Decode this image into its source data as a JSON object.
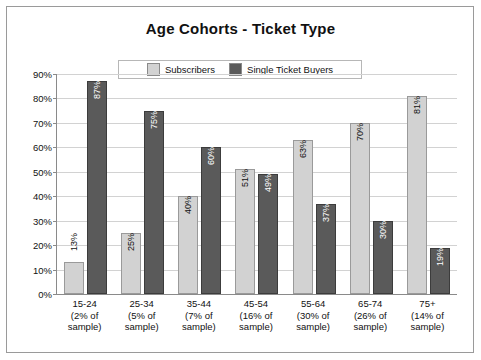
{
  "chart_data": {
    "type": "bar",
    "title": "Age Cohorts - Ticket Type",
    "xlabel": "",
    "ylabel": "",
    "ylim": [
      0,
      90
    ],
    "ytick_step": 10,
    "grid": true,
    "legend_position": "top-center",
    "categories": [
      "15-24",
      "25-34",
      "35-44",
      "45-54",
      "55-64",
      "65-74",
      "75+"
    ],
    "category_sublabels": [
      "(2% of\nsample)",
      "(5% of\nsample)",
      "(7% of\nsample)",
      "(16% of\nsample)",
      "(30% of\nsample)",
      "(26% of\nsample)",
      "(14% of\nsample)"
    ],
    "ytick_labels": [
      "0%",
      "10%",
      "20%",
      "30%",
      "40%",
      "50%",
      "60%",
      "70%",
      "80%",
      "90%"
    ],
    "series": [
      {
        "name": "Subscribers",
        "color": "#d2d2d2",
        "values": [
          13,
          25,
          40,
          51,
          63,
          70,
          81
        ],
        "labels": [
          "13%",
          "25%",
          "40%",
          "51%",
          "63%",
          "70%",
          "81%"
        ]
      },
      {
        "name": "Single Ticket Buyers",
        "color": "#5a5a5a",
        "values": [
          87,
          75,
          60,
          49,
          37,
          30,
          19
        ],
        "labels": [
          "87%",
          "75%",
          "60%",
          "49%",
          "37%",
          "30%",
          "19%"
        ]
      }
    ]
  },
  "legend": {
    "items": [
      {
        "label": "Subscribers",
        "color": "#d2d2d2"
      },
      {
        "label": "Single Ticket  Buyers",
        "color": "#5a5a5a"
      }
    ]
  }
}
